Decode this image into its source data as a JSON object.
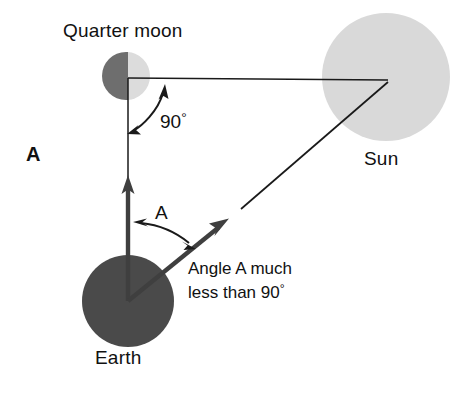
{
  "figure": {
    "panel_label": "A",
    "labels": {
      "quarter_moon": "Quarter moon",
      "earth": "Earth",
      "sun": "Sun",
      "right_angle": "90",
      "right_angle_degree_symbol": "°",
      "angle_a": "A",
      "note_line1": "Angle A much",
      "note_line2_text": "less than 90",
      "note_line2_degree_symbol": "°"
    },
    "colors": {
      "moon_dark_half": "#6e6e6e",
      "moon_lit_half": "#dcdcdc",
      "earth": "#4a4a4a",
      "sun": "#d9d9d9",
      "line": "#1a1a1a",
      "text": "#111111",
      "background": "#ffffff"
    },
    "bodies": [
      {
        "name": "quarter-moon",
        "cx": 126,
        "cy": 76,
        "r": 24
      },
      {
        "name": "earth",
        "cx": 128,
        "cy": 301,
        "r": 46
      },
      {
        "name": "sun",
        "cx": 386,
        "cy": 77,
        "r": 64
      }
    ],
    "geometry": {
      "vertex_moon": [
        128,
        78
      ],
      "vertex_earth": [
        128,
        301
      ],
      "vertex_sun": [
        388,
        82
      ],
      "earth_to_moon_arrow_tip": [
        128,
        176
      ],
      "earth_to_sun_arrow_tip": [
        228,
        218
      ],
      "sun_line_end": [
        241,
        209
      ]
    },
    "annotations": {
      "right_angle_value": 90,
      "right_angle_unit": "degrees",
      "angle_a_description": "Angle A much less than 90°"
    }
  }
}
